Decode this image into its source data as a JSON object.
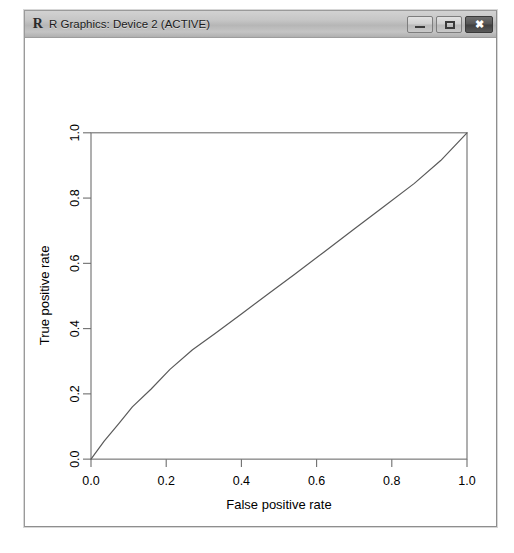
{
  "window": {
    "title": "R Graphics: Device 2 (ACTIVE)",
    "icon": "r-logo-icon",
    "controls": {
      "minimize_label": "",
      "maximize_label": "",
      "close_label": "✖"
    }
  },
  "chart_data": {
    "type": "line",
    "title": "",
    "xlabel": "False positive rate",
    "ylabel": "True positive rate",
    "xlim": [
      0.0,
      1.0
    ],
    "ylim": [
      0.0,
      1.0
    ],
    "xticks": [
      "0.0",
      "0.2",
      "0.4",
      "0.6",
      "0.8",
      "1.0"
    ],
    "yticks": [
      "0.0",
      "0.2",
      "0.4",
      "0.6",
      "0.8",
      "1.0"
    ],
    "xtick_values": [
      0.0,
      0.2,
      0.4,
      0.6,
      0.8,
      1.0
    ],
    "ytick_values": [
      0.0,
      0.2,
      0.4,
      0.6,
      0.8,
      1.0
    ],
    "grid": false,
    "legend": false,
    "line_color": "#5a5a5a",
    "series": [
      {
        "name": "ROC curve",
        "x": [
          0.0,
          0.035,
          0.075,
          0.11,
          0.16,
          0.21,
          0.27,
          0.33,
          0.4,
          0.47,
          0.54,
          0.62,
          0.7,
          0.78,
          0.86,
          0.93,
          1.0
        ],
        "y": [
          0.0,
          0.055,
          0.11,
          0.16,
          0.215,
          0.275,
          0.335,
          0.385,
          0.445,
          0.505,
          0.565,
          0.635,
          0.705,
          0.775,
          0.845,
          0.915,
          1.0
        ]
      }
    ]
  }
}
